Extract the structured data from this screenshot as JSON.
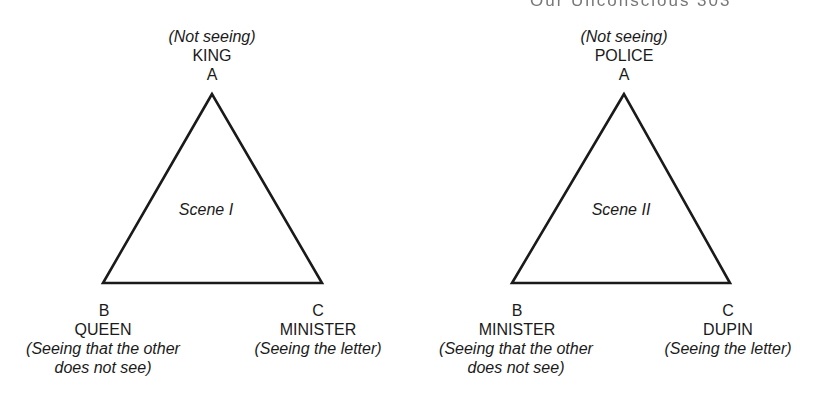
{
  "page_header": "Our Unconscious   303",
  "scenes": [
    {
      "title": "Scene I",
      "vertices": {
        "A": {
          "letter": "A",
          "role": "KING",
          "note": "(Not seeing)"
        },
        "B": {
          "letter": "B",
          "role": "QUEEN",
          "note_line1": "(Seeing that the other",
          "note_line2": "does not see)"
        },
        "C": {
          "letter": "C",
          "role": "MINISTER",
          "note": "(Seeing the letter)"
        }
      }
    },
    {
      "title": "Scene II",
      "vertices": {
        "A": {
          "letter": "A",
          "role": "POLICE",
          "note": "(Not seeing)"
        },
        "B": {
          "letter": "B",
          "role": "MINISTER",
          "note_line1": "(Seeing that the other",
          "note_line2": "does not see)"
        },
        "C": {
          "letter": "C",
          "role": "DUPIN",
          "note": "(Seeing the letter)"
        }
      }
    }
  ],
  "colors": {
    "line": "#1a1a1a",
    "text": "#1a1a1a",
    "background": "#ffffff"
  }
}
